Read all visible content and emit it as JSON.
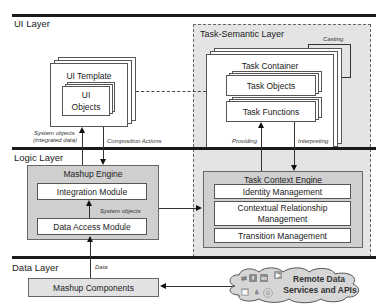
{
  "layers": {
    "ui": "UI Layer",
    "logic": "Logic Layer",
    "data": "Data Layer"
  },
  "task_semantic_layer": {
    "title": "Task-Semantic Layer",
    "casting_label": "Casting",
    "task_container": "Task Container",
    "task_objects": "Task Objects",
    "task_functions": "Task Functions"
  },
  "ui_template": {
    "title": "UI Template",
    "ui_objects_line1": "UI",
    "ui_objects_line2": "Objects"
  },
  "connectors": {
    "system_objects_line1": "System objects",
    "system_objects_line2": "(integrated data)",
    "composition_actions": "Composition Actions",
    "providing": "Providing",
    "interpreting": "Interpreting",
    "system_objects_inner": "System objects",
    "data": "Data"
  },
  "mashup_engine": {
    "title": "Mashup Engine",
    "integration_module": "Integration Module",
    "data_access_module": "Data Access Module"
  },
  "task_context_engine": {
    "title": "Task Context Engine",
    "identity_management": "Identity Management",
    "contextual_relationship_line1": "Contextual Relationship",
    "contextual_relationship_line2": "Management",
    "transition_management": "Transition Management"
  },
  "data_layer": {
    "mashup_components": "Mashup Components",
    "remote_line1": "Remote Data",
    "remote_line2": "Services and APIs",
    "service_icons": [
      "share-icon",
      "facebook-icon",
      "linkedin-icon",
      "youtube-icon",
      "image-icon",
      "group-icon",
      "google-icon"
    ]
  },
  "colors": {
    "layer_line": "#1a1a1a",
    "engine_fill": "#cfcfcf",
    "semantic_region_fill": "#e4e4e4",
    "cloud_fill": "#d6d6d6"
  }
}
